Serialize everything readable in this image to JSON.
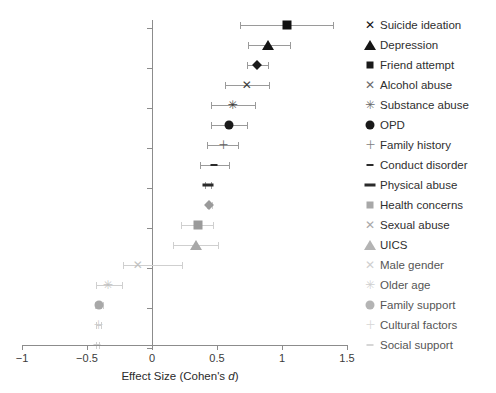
{
  "chart_data": {
    "type": "scatter",
    "title": "",
    "xlabel": "Effect Size (Cohen's d)",
    "ylabel": "",
    "xlim": [
      -1,
      1.5
    ],
    "xticks": [
      -1,
      -0.5,
      0,
      0.5,
      1,
      1.5
    ],
    "xticklabels": [
      "−1",
      "−0.5",
      "0",
      "0.5",
      "1",
      "1.5"
    ],
    "grid": false,
    "legend_position": "right",
    "reference_line": 0,
    "series": [
      {
        "name": "Suicide ideation",
        "marker": "filled-square",
        "color": "#111111",
        "value": 1.04,
        "ci_low": 0.68,
        "ci_high": 1.39
      },
      {
        "name": "Depression",
        "marker": "filled-triangle",
        "color": "#151515",
        "value": 0.89,
        "ci_low": 0.74,
        "ci_high": 1.06
      },
      {
        "name": "Friend attempt",
        "marker": "filled-diamond",
        "color": "#1a1a1a",
        "value": 0.81,
        "ci_low": 0.73,
        "ci_high": 0.89
      },
      {
        "name": "Alcohol abuse",
        "marker": "x",
        "color": "#3d3d3d",
        "value": 0.73,
        "ci_low": 0.56,
        "ci_high": 0.9
      },
      {
        "name": "Substance abuse",
        "marker": "star",
        "color": "#3d3d3d",
        "value": 0.62,
        "ci_low": 0.45,
        "ci_high": 0.79
      },
      {
        "name": "OPD",
        "marker": "filled-circle",
        "color": "#1a1a1a",
        "value": 0.59,
        "ci_low": 0.45,
        "ci_high": 0.73
      },
      {
        "name": "Family history",
        "marker": "plus",
        "color": "#5e5e5e",
        "value": 0.55,
        "ci_low": 0.42,
        "ci_high": 0.66
      },
      {
        "name": "Conduct disorder",
        "marker": "small-dash",
        "color": "#2b2b2b",
        "value": 0.48,
        "ci_low": 0.37,
        "ci_high": 0.59
      },
      {
        "name": "Physical abuse",
        "marker": "wide-dash",
        "color": "#2b2b2b",
        "value": 0.43,
        "ci_low": 0.41,
        "ci_high": 0.45
      },
      {
        "name": "Health concerns",
        "marker": "filled-diamond",
        "color": "#9a9a9a",
        "value": 0.44,
        "ci_low": 0.42,
        "ci_high": 0.46
      },
      {
        "name": "Sexual abuse",
        "marker": "filled-square",
        "color": "#9a9a9a",
        "value": 0.35,
        "ci_low": 0.22,
        "ci_high": 0.47
      },
      {
        "name": "UICS",
        "marker": "filled-triangle",
        "color": "#a8a8a8",
        "value": 0.34,
        "ci_low": 0.16,
        "ci_high": 0.51
      },
      {
        "name": "Male gender",
        "marker": "x",
        "color": "#c2c2c2",
        "value": -0.11,
        "ci_low": -0.22,
        "ci_high": 0.23
      },
      {
        "name": "Older age",
        "marker": "star",
        "color": "#c2c2c2",
        "value": -0.34,
        "ci_low": -0.43,
        "ci_high": -0.23
      },
      {
        "name": "Family support",
        "marker": "filled-circle",
        "color": "#a8a8a8",
        "value": -0.41,
        "ci_low": -0.44,
        "ci_high": -0.38
      },
      {
        "name": "Cultural factors",
        "marker": "plus",
        "color": "#cccccc",
        "value": -0.41,
        "ci_low": -0.43,
        "ci_high": -0.39
      },
      {
        "name": "Social support",
        "marker": "small-dash",
        "color": "#cfcfcf",
        "value": -0.42,
        "ci_low": -0.43,
        "ci_high": -0.41
      }
    ]
  },
  "legend": {
    "items": [
      {
        "label": "Suicide ideation",
        "marker": "filled-square-icon",
        "color": "#111111"
      },
      {
        "label": "Depression",
        "marker": "filled-triangle-icon",
        "color": "#151515"
      },
      {
        "label": "Friend attempt",
        "marker": "filled-diamond-icon",
        "color": "#1a1a1a"
      },
      {
        "label": "Alcohol abuse",
        "marker": "x-icon",
        "color": "#6a6a6a"
      },
      {
        "label": "Substance abuse",
        "marker": "star-icon",
        "color": "#6a6a6a"
      },
      {
        "label": "OPD",
        "marker": "filled-circle-icon",
        "color": "#1a1a1a"
      },
      {
        "label": "Family history",
        "marker": "plus-icon",
        "color": "#7d7d7d"
      },
      {
        "label": "Conduct disorder",
        "marker": "small-dash-icon",
        "color": "#2b2b2b"
      },
      {
        "label": "Physical abuse",
        "marker": "wide-dash-icon",
        "color": "#2b2b2b"
      },
      {
        "label": "Health concerns",
        "marker": "filled-diamond-icon",
        "color": "#a8a8a8"
      },
      {
        "label": "Sexual abuse",
        "marker": "filled-square-icon",
        "color": "#a8a8a8"
      },
      {
        "label": "UICS",
        "marker": "filled-triangle-icon",
        "color": "#b4b4b4"
      },
      {
        "label": "Male gender",
        "marker": "x-icon",
        "color": "#cfcfcf"
      },
      {
        "label": "Older age",
        "marker": "star-icon",
        "color": "#cfcfcf"
      },
      {
        "label": "Family support",
        "marker": "filled-circle-icon",
        "color": "#b4b4b4"
      },
      {
        "label": "Cultural factors",
        "marker": "plus-icon",
        "color": "#d6d6d6"
      },
      {
        "label": "Social support",
        "marker": "small-dash-icon",
        "color": "#d6d6d6"
      }
    ]
  },
  "axis": {
    "title": "Effect Size (Cohen's ",
    "title_italic": "d",
    "title_end": ")",
    "ticklabels": [
      "−1",
      "−0.5",
      "0",
      "0.5",
      "1",
      "1.5"
    ]
  },
  "colors": {
    "axis": "#8c8c8c",
    "ci": "#9a9a9a",
    "text": "#2f2f2f"
  }
}
